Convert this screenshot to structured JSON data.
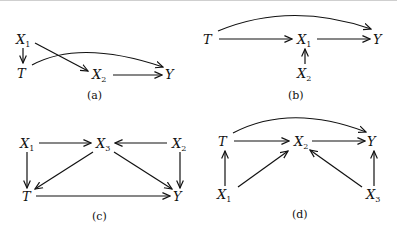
{
  "panels": [
    {
      "caption": "(a)",
      "nodes": [
        {
          "id": "X1",
          "name": "X",
          "sub": "1"
        },
        {
          "id": "T",
          "name": "T",
          "sub": ""
        },
        {
          "id": "X2",
          "name": "X",
          "sub": "2"
        },
        {
          "id": "Y",
          "name": "Y",
          "sub": ""
        }
      ],
      "edges": [
        [
          "X1",
          "T"
        ],
        [
          "X1",
          "X2"
        ],
        [
          "X2",
          "Y"
        ],
        [
          "T",
          "Y"
        ]
      ]
    },
    {
      "caption": "(b)",
      "nodes": [
        {
          "id": "T",
          "name": "T",
          "sub": ""
        },
        {
          "id": "X1",
          "name": "X",
          "sub": "1"
        },
        {
          "id": "X2",
          "name": "X",
          "sub": "2"
        },
        {
          "id": "Y",
          "name": "Y",
          "sub": ""
        }
      ],
      "edges": [
        [
          "T",
          "X1"
        ],
        [
          "X1",
          "Y"
        ],
        [
          "X2",
          "X1"
        ],
        [
          "T",
          "Y"
        ]
      ]
    },
    {
      "caption": "(c)",
      "nodes": [
        {
          "id": "X1",
          "name": "X",
          "sub": "1"
        },
        {
          "id": "X3",
          "name": "X",
          "sub": "3"
        },
        {
          "id": "X2",
          "name": "X",
          "sub": "2"
        },
        {
          "id": "T",
          "name": "T",
          "sub": ""
        },
        {
          "id": "Y",
          "name": "Y",
          "sub": ""
        }
      ],
      "edges": [
        [
          "X1",
          "X3"
        ],
        [
          "X2",
          "X3"
        ],
        [
          "X1",
          "T"
        ],
        [
          "X3",
          "T"
        ],
        [
          "X3",
          "Y"
        ],
        [
          "X2",
          "Y"
        ],
        [
          "T",
          "Y"
        ]
      ]
    },
    {
      "caption": "(d)",
      "nodes": [
        {
          "id": "T",
          "name": "T",
          "sub": ""
        },
        {
          "id": "X2",
          "name": "X",
          "sub": "2"
        },
        {
          "id": "Y",
          "name": "Y",
          "sub": ""
        },
        {
          "id": "X1",
          "name": "X",
          "sub": "1"
        },
        {
          "id": "X3",
          "name": "X",
          "sub": "3"
        }
      ],
      "edges": [
        [
          "T",
          "X2"
        ],
        [
          "X2",
          "Y"
        ],
        [
          "T",
          "Y"
        ],
        [
          "X1",
          "T"
        ],
        [
          "X1",
          "X2"
        ],
        [
          "X3",
          "X2"
        ],
        [
          "X3",
          "Y"
        ]
      ]
    }
  ]
}
